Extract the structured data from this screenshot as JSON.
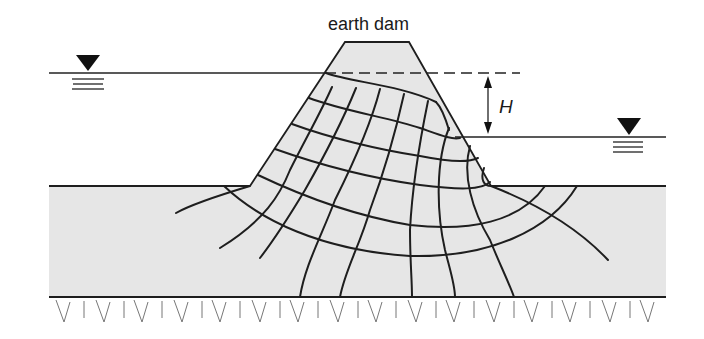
{
  "diagram": {
    "title": "earth dam",
    "head_label": "H",
    "colors": {
      "soil_fill": "#e6e6e6",
      "line": "#1e1e1e",
      "background": "#ffffff"
    },
    "elements": {
      "upstream_water_symbol": "water-level-triangle",
      "downstream_water_symbol": "water-level-triangle",
      "head_arrow": "double-headed-vertical-arrow",
      "impermeable_base": "hatched-rock-boundary"
    }
  }
}
